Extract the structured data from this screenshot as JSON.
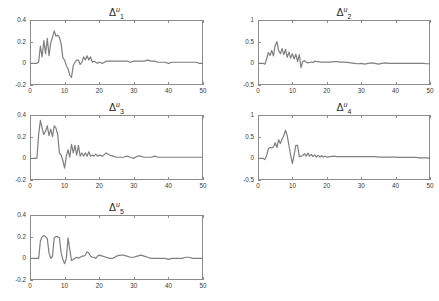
{
  "figure": {
    "background": "#ffffff",
    "line_color": "#7f7f7f",
    "axis_color": "#8c8c8c",
    "tick_label_color": "#3a3a3a"
  },
  "chart_data": [
    {
      "id": "panel1",
      "type": "line",
      "title": "Δ",
      "title_sup": "u",
      "title_sub": "1",
      "xlabel": "",
      "ylabel": "",
      "xlim": [
        0,
        50
      ],
      "ylim": [
        -0.2,
        0.4
      ],
      "xticks": [
        0,
        10,
        20,
        30,
        40,
        50
      ],
      "xticklabels": [
        "0",
        "10",
        "20",
        "30",
        "40",
        "50"
      ],
      "yticks": [
        0.4,
        0.2,
        0,
        -0.2
      ],
      "yticklabels": [
        "0.4",
        "0.2",
        "0",
        "-0.2"
      ],
      "grid": false,
      "legend": null,
      "series": [
        {
          "name": "delta_u_1",
          "x": [
            0,
            0.5,
            1,
            1.5,
            2,
            2.5,
            3,
            3.5,
            4,
            4.5,
            5,
            5.5,
            6,
            6.5,
            7,
            7.5,
            8,
            8.5,
            9,
            9.5,
            10,
            10.5,
            11,
            11.5,
            12,
            12.5,
            13,
            13.5,
            14,
            14.5,
            15,
            15.5,
            16,
            16.5,
            17,
            17.5,
            18,
            18.5,
            19,
            19.5,
            20,
            21,
            22,
            23,
            24,
            25,
            26,
            27,
            28,
            29,
            30,
            31,
            32,
            33,
            34,
            35,
            36,
            37,
            38,
            39,
            40,
            41,
            42,
            43,
            44,
            45,
            46,
            47,
            48,
            49,
            50
          ],
          "values": [
            0,
            0,
            0,
            0,
            0,
            0.01,
            0.16,
            0.06,
            0.21,
            0.09,
            0.23,
            0.07,
            0.19,
            0.24,
            0.3,
            0.25,
            0.26,
            0.24,
            0.18,
            0.05,
            0.03,
            -0.02,
            -0.05,
            -0.11,
            -0.13,
            -0.02,
            0.01,
            0.03,
            0.03,
            -0.01,
            0.01,
            0.06,
            0.03,
            0.07,
            0.03,
            0.06,
            0.01,
            0.02,
            0.01,
            0.0,
            0.01,
            0.0,
            0.02,
            0.02,
            0.02,
            0.02,
            0.02,
            0.02,
            0.02,
            0.01,
            0.02,
            0.02,
            0.02,
            0.02,
            0.03,
            0.02,
            0.02,
            0.01,
            0.01,
            0.01,
            0.0,
            0.01,
            0.01,
            0.01,
            0.01,
            0.01,
            0.01,
            0.01,
            0.01,
            0.0,
            0.0
          ]
        }
      ]
    },
    {
      "id": "panel2",
      "type": "line",
      "title": "Δ",
      "title_sup": "u",
      "title_sub": "2",
      "xlabel": "",
      "ylabel": "",
      "xlim": [
        0,
        50
      ],
      "ylim": [
        -0.5,
        1.0
      ],
      "xticks": [
        0,
        10,
        20,
        30,
        40,
        50
      ],
      "xticklabels": [
        "0",
        "10",
        "20",
        "30",
        "40",
        "50"
      ],
      "yticks": [
        1,
        0.5,
        0,
        -0.5
      ],
      "yticklabels": [
        "1",
        "0.5",
        "0",
        "-0.5"
      ],
      "grid": false,
      "legend": null,
      "series": [
        {
          "name": "delta_u_2",
          "x": [
            0,
            0.5,
            1,
            1.5,
            2,
            2.5,
            3,
            3.5,
            4,
            4.5,
            5,
            5.5,
            6,
            6.5,
            7,
            7.5,
            8,
            8.5,
            9,
            9.5,
            10,
            10.5,
            11,
            11.5,
            12,
            12.5,
            13,
            13.5,
            14,
            14.5,
            15,
            15.5,
            16,
            16.5,
            17,
            17.5,
            18,
            18.5,
            19,
            19.5,
            20,
            21,
            22,
            23,
            24,
            25,
            26,
            27,
            28,
            29,
            30,
            31,
            32,
            33,
            34,
            35,
            36,
            37,
            38,
            39,
            40,
            41,
            42,
            43,
            44,
            45,
            46,
            47,
            48,
            49,
            50
          ],
          "values": [
            0,
            0,
            0,
            0,
            -0.02,
            0.1,
            0.25,
            0.18,
            0.3,
            0.17,
            0.41,
            0.5,
            0.3,
            0.22,
            0.34,
            0.2,
            0.32,
            0.14,
            0.26,
            0.12,
            0.22,
            0.1,
            0.21,
            0.04,
            0.2,
            -0.1,
            0.04,
            0.06,
            0.03,
            0.01,
            0.02,
            0.03,
            0.02,
            0.05,
            0.04,
            0.04,
            0.03,
            0.03,
            0.03,
            0.03,
            0.03,
            0.03,
            0.04,
            0.04,
            0.03,
            0.03,
            0.02,
            0.01,
            0.0,
            -0.01,
            0.0,
            -0.02,
            0.0,
            0.01,
            0.0,
            -0.02,
            0.0,
            0.01,
            0.0,
            0.0,
            0.0,
            0.0,
            0.0,
            0.0,
            0.0,
            0.0,
            0.0,
            0.0,
            0.0,
            -0.01,
            -0.01
          ]
        }
      ]
    },
    {
      "id": "panel3",
      "type": "line",
      "title": "Δ",
      "title_sup": "u",
      "title_sub": "3",
      "xlabel": "",
      "ylabel": "",
      "xlim": [
        0,
        50
      ],
      "ylim": [
        -0.2,
        0.4
      ],
      "xticks": [
        0,
        10,
        20,
        30,
        40,
        50
      ],
      "xticklabels": [
        "0",
        "10",
        "20",
        "30",
        "40",
        "50"
      ],
      "yticks": [
        0.4,
        0.2,
        0,
        -0.2
      ],
      "yticklabels": [
        "0.4",
        "0.2",
        "0",
        "-0.2"
      ],
      "grid": false,
      "legend": null,
      "series": [
        {
          "name": "delta_u_3",
          "x": [
            0,
            0.5,
            1,
            1.5,
            2,
            2.5,
            3,
            3.5,
            4,
            4.5,
            5,
            5.5,
            6,
            6.5,
            7,
            7.5,
            8,
            8.5,
            9,
            9.5,
            10,
            10.5,
            11,
            11.5,
            12,
            12.5,
            13,
            13.5,
            14,
            14.5,
            15,
            15.5,
            16,
            16.5,
            17,
            17.5,
            18,
            18.5,
            19,
            19.5,
            20,
            21,
            22,
            23,
            24,
            25,
            26,
            27,
            28,
            29,
            30,
            31,
            32,
            33,
            34,
            35,
            36,
            37,
            38,
            39,
            40,
            41,
            42,
            43,
            44,
            45,
            46,
            47,
            48,
            49,
            50
          ],
          "values": [
            0,
            0,
            0,
            0,
            0.0,
            0.22,
            0.35,
            0.28,
            0.22,
            0.25,
            0.3,
            0.21,
            0.27,
            0.2,
            0.3,
            0.28,
            0.22,
            0.05,
            0.03,
            -0.02,
            -0.09,
            0.02,
            0.08,
            0.01,
            0.13,
            0.05,
            0.12,
            0.03,
            0.12,
            0.02,
            0.05,
            0.02,
            0.05,
            0.02,
            0.06,
            0.02,
            0.03,
            0.02,
            0.04,
            0.02,
            0.03,
            0.02,
            0.05,
            0.03,
            0.02,
            0.01,
            0.01,
            0.01,
            0.02,
            0.01,
            0.0,
            0.02,
            0.02,
            0.01,
            0.01,
            0.01,
            0.02,
            0.01,
            0.01,
            0.01,
            0.01,
            0.01,
            0.01,
            0.01,
            0.01,
            0.01,
            0.01,
            0.01,
            0.01,
            0.01,
            0.01
          ]
        }
      ]
    },
    {
      "id": "panel4",
      "type": "line",
      "title": "Δ",
      "title_sup": "u",
      "title_sub": "4",
      "xlabel": "",
      "ylabel": "",
      "xlim": [
        0,
        50
      ],
      "ylim": [
        -0.5,
        1.0
      ],
      "xticks": [
        0,
        10,
        20,
        30,
        40,
        50
      ],
      "xticklabels": [
        "0",
        "10",
        "20",
        "30",
        "40",
        "50"
      ],
      "yticks": [
        1,
        0.5,
        0,
        -0.5
      ],
      "yticklabels": [
        "1",
        "0.5",
        "0",
        "-0.5"
      ],
      "grid": false,
      "legend": null,
      "series": [
        {
          "name": "delta_u_4",
          "x": [
            0,
            0.5,
            1,
            1.5,
            2,
            2.5,
            3,
            3.5,
            4,
            4.5,
            5,
            5.5,
            6,
            6.5,
            7,
            7.5,
            8,
            8.5,
            9,
            9.5,
            10,
            10.5,
            11,
            11.5,
            12,
            12.5,
            13,
            13.5,
            14,
            14.5,
            15,
            15.5,
            16,
            16.5,
            17,
            17.5,
            18,
            18.5,
            19,
            19.5,
            20,
            21,
            22,
            23,
            24,
            25,
            26,
            27,
            28,
            29,
            30,
            31,
            32,
            33,
            34,
            35,
            36,
            37,
            38,
            39,
            40,
            41,
            42,
            43,
            44,
            45,
            46,
            47,
            48,
            49,
            50
          ],
          "values": [
            0,
            0,
            0,
            0,
            -0.03,
            0.06,
            0.22,
            0.25,
            0.24,
            0.26,
            0.36,
            0.25,
            0.43,
            0.34,
            0.44,
            0.52,
            0.65,
            0.52,
            0.3,
            0.06,
            -0.12,
            0.08,
            0.3,
            0.3,
            0.04,
            0.05,
            0.06,
            0.11,
            0.05,
            0.12,
            0.05,
            0.09,
            0.04,
            0.08,
            0.03,
            0.07,
            0.03,
            0.06,
            0.03,
            0.05,
            0.03,
            0.04,
            0.05,
            0.04,
            0.04,
            0.04,
            0.04,
            0.04,
            0.04,
            0.04,
            0.04,
            0.04,
            0.04,
            0.04,
            0.04,
            0.03,
            0.03,
            0.03,
            0.03,
            0.03,
            0.03,
            0.02,
            0.02,
            0.02,
            0.02,
            0.02,
            0.02,
            0.01,
            0.01,
            0.01,
            0.0
          ]
        }
      ]
    },
    {
      "id": "panel5",
      "type": "line",
      "title": "Δ",
      "title_sup": "u",
      "title_sub": "5",
      "xlabel": "",
      "ylabel": "",
      "xlim": [
        0,
        50
      ],
      "ylim": [
        -0.2,
        0.4
      ],
      "xticks": [
        0,
        10,
        20,
        30,
        40,
        50
      ],
      "xticklabels": [
        "0",
        "10",
        "20",
        "30",
        "40",
        "50"
      ],
      "yticks": [
        0.4,
        0.2,
        0,
        -0.2
      ],
      "yticklabels": [
        "0.4",
        "0.2",
        "0",
        "-0.2"
      ],
      "grid": false,
      "legend": null,
      "series": [
        {
          "name": "delta_u_5",
          "x": [
            0,
            0.5,
            1,
            1.5,
            2,
            2.5,
            3,
            3.5,
            4,
            4.5,
            5,
            5.5,
            6,
            6.5,
            7,
            7.5,
            8,
            8.5,
            9,
            9.5,
            10,
            10.5,
            11,
            11.5,
            12,
            12.5,
            13,
            13.5,
            14,
            14.5,
            15,
            15.5,
            16,
            16.5,
            17,
            17.5,
            18,
            18.5,
            19,
            19.5,
            20,
            21,
            22,
            23,
            24,
            25,
            26,
            27,
            28,
            29,
            30,
            31,
            32,
            33,
            34,
            35,
            36,
            37,
            38,
            39,
            40,
            41,
            42,
            43,
            44,
            45,
            46,
            47,
            48,
            49,
            50
          ],
          "values": [
            0,
            0,
            0,
            0,
            0.0,
            0.0,
            0.16,
            0.2,
            0.21,
            0.2,
            0.18,
            0.05,
            0.0,
            0.02,
            0.19,
            0.2,
            0.2,
            0.19,
            0.05,
            -0.01,
            -0.05,
            0.0,
            0.19,
            0.08,
            -0.02,
            -0.01,
            0.0,
            0.01,
            0.0,
            0.01,
            0.02,
            0.02,
            0.03,
            0.06,
            0.05,
            0.02,
            0.01,
            0.01,
            0.0,
            0.02,
            0.03,
            0.02,
            0.01,
            0.0,
            0.0,
            0.02,
            0.03,
            0.03,
            0.02,
            0.01,
            0.01,
            0.02,
            0.03,
            0.02,
            0.01,
            0.0,
            0.0,
            0.0,
            0.0,
            0.0,
            -0.01,
            0.0,
            0.0,
            0.0,
            0.0,
            0.01,
            0.01,
            0.0,
            0.0,
            0.0,
            0.0
          ]
        }
      ]
    }
  ]
}
